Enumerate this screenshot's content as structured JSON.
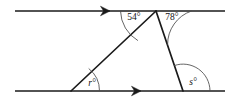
{
  "figure": {
    "background_color": "#ffffff",
    "line_color": "#1a1a1a",
    "arc_color": "#4a4a4a",
    "label_color": "#111111",
    "width": 232,
    "height": 109
  },
  "lines": {
    "top_parallel": {
      "name": "top parallel line",
      "x1": 15,
      "y1": 11,
      "x2": 225,
      "y2": 11,
      "arrow_at_x": 108,
      "arrow_at_y": 11
    },
    "bottom_parallel": {
      "name": "bottom parallel line",
      "x1": 15,
      "y1": 91,
      "x2": 225,
      "y2": 91,
      "arrow_at_x": 139,
      "arrow_at_y": 91
    }
  },
  "triangle": {
    "apex": {
      "x": 156,
      "y": 11
    },
    "left_vertex": {
      "x": 71,
      "y": 91
    },
    "right_vertex": {
      "x": 183,
      "y": 91
    }
  },
  "angles": [
    {
      "id": "angle-54",
      "label": "54°",
      "value": 54,
      "unit": "degrees",
      "vertex": "apex",
      "label_x": 134,
      "label_y": 17,
      "arc_path": "M 120.5 11 A 35.5 35.5 0 0 0 137.9 40.6"
    },
    {
      "id": "angle-78",
      "label": "78°",
      "value": 78,
      "unit": "degrees",
      "vertex": "apex",
      "label_x": 172,
      "label_y": 17,
      "arc_path": "M 191.5 11 A 35.5 35.5 0 0 0 167.6 44.7"
    },
    {
      "id": "angle-r",
      "label": "r°",
      "value": "r",
      "unit": "degrees",
      "vertex": "left_vertex",
      "label_x": 92,
      "label_y": 83,
      "arc_path": "M 99.5 91 A 28.5 28.5 0 0 0 88.7 68.5"
    },
    {
      "id": "angle-s",
      "label": "s°",
      "value": "s",
      "unit": "degrees",
      "vertex": "right_vertex",
      "label_x": 193,
      "label_y": 82,
      "arc_path": "M 210 91 A 27 27 0 0 0 174.2 65.6"
    }
  ],
  "arrow_markers": [
    {
      "id": "top-arrow",
      "name": "rightward direction arrow on top line",
      "x": 108,
      "y": 11
    },
    {
      "id": "bottom-arrow",
      "name": "rightward direction arrow on bottom line",
      "x": 139,
      "y": 91
    }
  ]
}
